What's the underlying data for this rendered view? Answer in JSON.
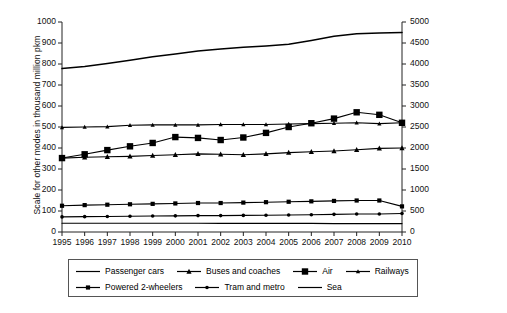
{
  "chart_data": {
    "type": "line",
    "title": "",
    "subtitle": "",
    "xlabel": "",
    "ylabel": "Scale for other modes in thousand million pkm",
    "y2label": "Passenger cars scale",
    "grid": false,
    "legend_position": "bottom",
    "x": [
      1995,
      1996,
      1997,
      1998,
      1999,
      2000,
      2001,
      2002,
      2003,
      2004,
      2005,
      2006,
      2007,
      2008,
      2009,
      2010
    ],
    "categories": [
      "1995",
      "1996",
      "1997",
      "1998",
      "1999",
      "2000",
      "2001",
      "2002",
      "2003",
      "2004",
      "2005",
      "2006",
      "2007",
      "2008",
      "2009",
      "2010"
    ],
    "ylim": [
      0,
      1000
    ],
    "yticks": [
      0,
      100,
      200,
      300,
      400,
      500,
      600,
      700,
      800,
      900,
      1000
    ],
    "y2lim": [
      0,
      5000
    ],
    "y2ticks": [
      0,
      500,
      1000,
      1500,
      2000,
      2500,
      3000,
      3500,
      4000,
      4500,
      5000
    ],
    "series": [
      {
        "name": "Passenger cars",
        "axis": "right",
        "marker": "none",
        "values": [
          3890,
          3940,
          4010,
          4090,
          4170,
          4240,
          4310,
          4360,
          4400,
          4430,
          4470,
          4560,
          4660,
          4720,
          4740,
          4750
        ]
      },
      {
        "name": "Buses and coaches",
        "axis": "left",
        "marker": "triangle",
        "values": [
          352,
          356,
          358,
          360,
          364,
          368,
          372,
          370,
          368,
          372,
          378,
          382,
          386,
          392,
          398,
          400
        ]
      },
      {
        "name": "Air",
        "axis": "left",
        "marker": "square-large",
        "values": [
          352,
          370,
          390,
          408,
          424,
          452,
          448,
          438,
          450,
          472,
          500,
          518,
          540,
          570,
          558,
          520
        ]
      },
      {
        "name": "Railways",
        "axis": "left",
        "marker": "triangle-small",
        "values": [
          498,
          500,
          502,
          508,
          510,
          510,
          510,
          512,
          512,
          512,
          514,
          516,
          518,
          520,
          516,
          520
        ]
      },
      {
        "name": "Powered 2-wheelers",
        "axis": "left",
        "marker": "square-small",
        "values": [
          125,
          128,
          130,
          132,
          134,
          136,
          138,
          138,
          140,
          142,
          144,
          146,
          148,
          150,
          150,
          122
        ]
      },
      {
        "name": "Tram and metro",
        "axis": "left",
        "marker": "dot",
        "values": [
          72,
          73,
          74,
          75,
          76,
          77,
          78,
          78,
          79,
          80,
          81,
          82,
          84,
          86,
          86,
          88
        ]
      },
      {
        "name": "Sea",
        "axis": "left",
        "marker": "none",
        "values": [
          42,
          42,
          42,
          42,
          42,
          42,
          42,
          41,
          41,
          41,
          41,
          41,
          40,
          40,
          40,
          40
        ]
      }
    ]
  },
  "legend": {
    "row1": [
      "Passenger cars",
      "Buses and coaches",
      "Air",
      "Railways"
    ],
    "row2": [
      "Powered 2-wheelers",
      "Tram and metro",
      "Sea"
    ]
  },
  "colors": {
    "line": "#000000",
    "axis": "#222222",
    "background": "#ffffff",
    "legend_border": "#555555"
  }
}
